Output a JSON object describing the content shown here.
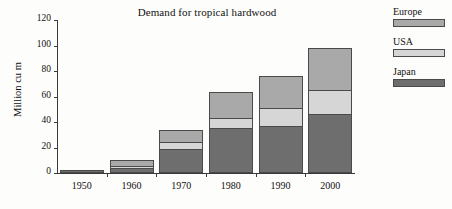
{
  "chart_data": {
    "type": "bar",
    "subtype": "stacked-vertical",
    "title": "Demand for tropical hardwood",
    "xlabel": "",
    "ylabel": "Million cu m",
    "categories": [
      "1950",
      "1960",
      "1970",
      "1980",
      "1990",
      "2000"
    ],
    "ylim": [
      0,
      120
    ],
    "yticks": [
      0,
      20,
      40,
      60,
      80,
      100,
      120
    ],
    "ytick_labels": [
      "0",
      "20",
      "40",
      "60",
      "80",
      "100",
      "120"
    ],
    "grid": false,
    "legend_position": "right",
    "series": [
      {
        "name": "Japan",
        "color": "#6e6e6e",
        "values": [
          2,
          4,
          19,
          35,
          37,
          46
        ]
      },
      {
        "name": "USA",
        "color": "#d6d6d6",
        "values": [
          1,
          2,
          6,
          9,
          15,
          20
        ]
      },
      {
        "name": "Europe",
        "color": "#a9a9a9",
        "values": [
          1,
          6,
          10,
          21,
          26,
          34
        ]
      }
    ],
    "stack_order_bottom_to_top": [
      "Japan",
      "USA",
      "Europe"
    ],
    "totals": [
      4,
      12,
      35,
      65,
      78,
      100
    ],
    "annotations": []
  },
  "legend": {
    "entries": [
      {
        "label": "Europe",
        "color": "#a9a9a9"
      },
      {
        "label": "USA",
        "color": "#d6d6d6"
      },
      {
        "label": "Japan",
        "color": "#6e6e6e"
      }
    ]
  }
}
